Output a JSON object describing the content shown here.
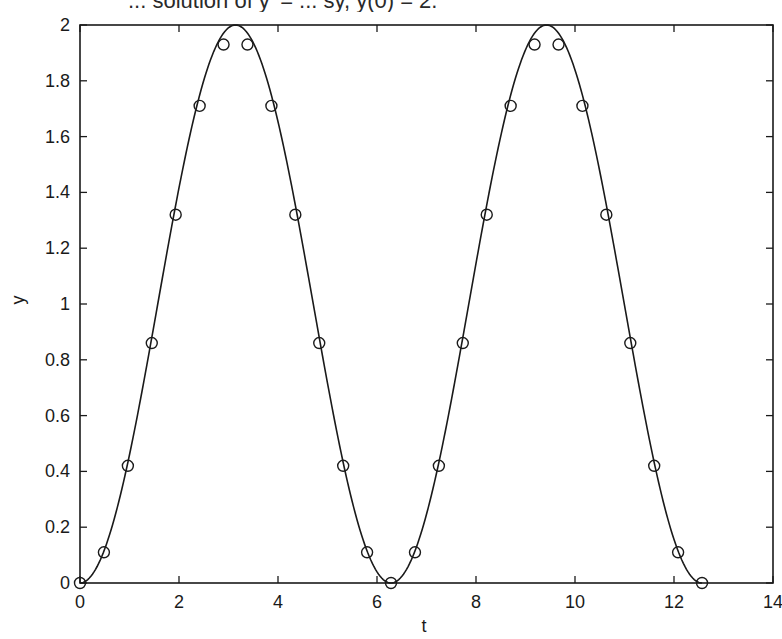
{
  "chart_data": {
    "type": "line",
    "title": "... solution of y' = ... sy, y(0) = 2.",
    "xlabel": "t",
    "ylabel": "y",
    "xlim": [
      0,
      14
    ],
    "ylim": [
      0,
      2
    ],
    "xticks": [
      0,
      2,
      4,
      6,
      8,
      10,
      12,
      14
    ],
    "yticks": [
      0,
      0.2,
      0.4,
      0.6,
      0.8,
      1,
      1.2,
      1.4,
      1.6,
      1.8,
      2
    ],
    "xtick_labels": [
      "0",
      "2",
      "4",
      "6",
      "8",
      "10",
      "12",
      "14"
    ],
    "ytick_labels": [
      "0",
      "0.2",
      "0.4",
      "0.6",
      "0.8",
      "1",
      "1.2",
      "1.4",
      "1.6",
      "1.8",
      "2"
    ],
    "grid": false,
    "legend": null,
    "series": [
      {
        "name": "exact solution",
        "style": "solid-line",
        "formula": "y = 1 - cos(t)",
        "t_range": [
          0,
          12.566
        ],
        "x": [
          0,
          0.5,
          1,
          1.5,
          2,
          2.5,
          3,
          3.1416,
          3.5,
          4,
          4.5,
          5,
          5.5,
          6,
          6.2832,
          6.5,
          7,
          7.5,
          8,
          8.5,
          9,
          9.4248,
          9.5,
          10,
          10.5,
          11,
          11.5,
          12,
          12.5664
        ],
        "values": [
          0,
          0.122,
          0.46,
          0.929,
          1.416,
          1.801,
          1.99,
          2.0,
          1.936,
          1.654,
          1.211,
          0.716,
          0.291,
          0.04,
          0,
          0.023,
          0.246,
          0.653,
          1.146,
          1.602,
          1.911,
          2.0,
          1.997,
          1.839,
          1.476,
          0.996,
          0.525,
          0.156,
          0
        ]
      },
      {
        "name": "numerical approximation",
        "style": "circle-markers",
        "x": [
          0,
          0.483,
          0.967,
          1.45,
          1.933,
          2.417,
          2.9,
          3.383,
          3.867,
          4.35,
          4.833,
          5.317,
          5.8,
          6.283,
          6.767,
          7.25,
          7.733,
          8.217,
          8.7,
          9.183,
          9.667,
          10.15,
          10.633,
          11.117,
          11.6,
          12.083,
          12.566
        ],
        "values": [
          0,
          0.11,
          0.42,
          0.86,
          1.32,
          1.71,
          1.93,
          1.93,
          1.71,
          1.32,
          0.86,
          0.42,
          0.11,
          0,
          0.11,
          0.42,
          0.86,
          1.32,
          1.71,
          1.93,
          1.93,
          1.71,
          1.32,
          0.86,
          0.42,
          0.11,
          0
        ]
      }
    ]
  },
  "colors": {
    "line": "#1a1a1a",
    "axes": "#1a1a1a",
    "background": "#ffffff"
  },
  "plot_area_px": {
    "left": 80,
    "top": 25,
    "right": 773,
    "bottom": 583
  }
}
